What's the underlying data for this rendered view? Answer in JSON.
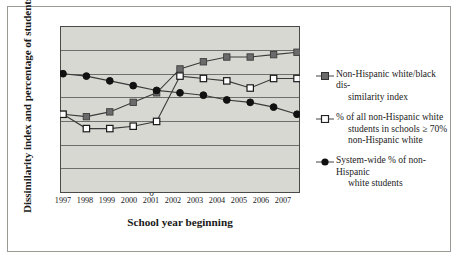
{
  "chart_data": {
    "type": "line",
    "title": "",
    "xlabel": "School year beginning",
    "ylabel": "Dissimilarity index and percentage of students",
    "categories": [
      "1997",
      "1998",
      "1999",
      "2000",
      "2001",
      "2002",
      "2003",
      "2004",
      "2005",
      "2006",
      "2007"
    ],
    "ylim": [
      0,
      70
    ],
    "yticks": [
      0,
      10,
      20,
      30,
      40,
      50,
      60,
      70
    ],
    "grid": true,
    "legend_position": "right",
    "series": [
      {
        "name": "Non-Hispanic white/black dissimilarity index",
        "marker": "filled-square",
        "color": "#6b6b6b",
        "values": [
          33,
          32,
          34,
          38,
          42,
          52,
          55,
          57,
          57,
          58,
          59
        ]
      },
      {
        "name": "% of all non-Hispanic white students in schools ≥ 70% non-Hispanic white",
        "marker": "open-square",
        "color": "#ffffff",
        "values": [
          33,
          27,
          27,
          28,
          30,
          49,
          48,
          47,
          44,
          48,
          48
        ]
      },
      {
        "name": "System-wide % of non-Hispanic white students",
        "marker": "filled-circle",
        "color": "#111111",
        "values": [
          50,
          49,
          47,
          45,
          43,
          42,
          41,
          39,
          38,
          36,
          33
        ]
      }
    ]
  },
  "legend": {
    "items": [
      {
        "line1": "Non-Hispanic white/black dis-",
        "line2": "similarity index",
        "line3": ""
      },
      {
        "line1": "% of all non-Hispanic white",
        "line2": "students in schools ≥ 70%",
        "line3": "non-Hispanic white"
      },
      {
        "line1": "System-wide % of non-Hispanic",
        "line2": "white students",
        "line3": ""
      }
    ]
  },
  "colors": {
    "plot_background": "#d8d8d2",
    "gridline": "#6e6e6c",
    "axis": "#4a4a48",
    "figure_border": "#9a9a95"
  }
}
